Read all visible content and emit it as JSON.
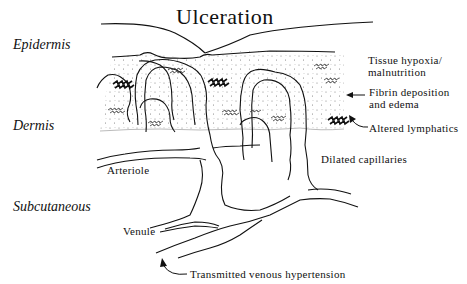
{
  "diagram": {
    "title": "Ulceration",
    "layers": {
      "epidermis": "Epidermis",
      "dermis": "Dermis",
      "subcutaneous": "Subcutaneous"
    },
    "annotations": {
      "tissue_hypoxia_line1": "Tissue hypoxia/",
      "tissue_hypoxia_line2": "malnutrition",
      "fibrin_line1": "Fibrin deposition",
      "fibrin_line2": "and edema",
      "altered_lymphatics": "Altered lymphatics",
      "dilated_capillaries": "Dilated capillaries",
      "arteriole": "Arteriole",
      "venule": "Venule",
      "transmitted": "Transmitted venous hypertension"
    },
    "colors": {
      "ink": "#111111",
      "stipple": "#7a7a7a",
      "background": "#ffffff"
    }
  }
}
